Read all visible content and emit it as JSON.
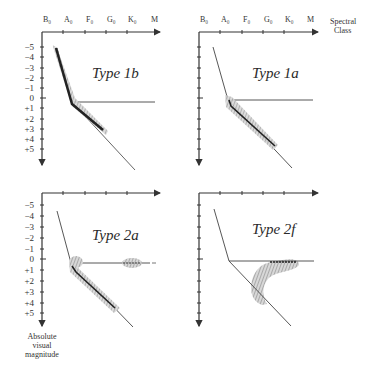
{
  "diagram": {
    "x_axis": {
      "label_line1": "Spectral",
      "label_line2": "Class",
      "ticks": [
        "B₀",
        "A₀",
        "F₀",
        "G₀",
        "K₀",
        "M"
      ]
    },
    "y_axis": {
      "label_line1": "Absolute",
      "label_line2": "visual",
      "label_line3": "magnitude",
      "ticks": [
        "−5",
        "−4",
        "−3",
        "−2",
        "−1",
        "0",
        "+1",
        "+2",
        "+3",
        "+4",
        "+5"
      ]
    },
    "panels": [
      {
        "id": "type-1b",
        "title": "Type 1b"
      },
      {
        "id": "type-1a",
        "title": "Type 1a"
      },
      {
        "id": "type-2a",
        "title": "Type 2a"
      },
      {
        "id": "type-2f",
        "title": "Type 2f"
      }
    ]
  }
}
